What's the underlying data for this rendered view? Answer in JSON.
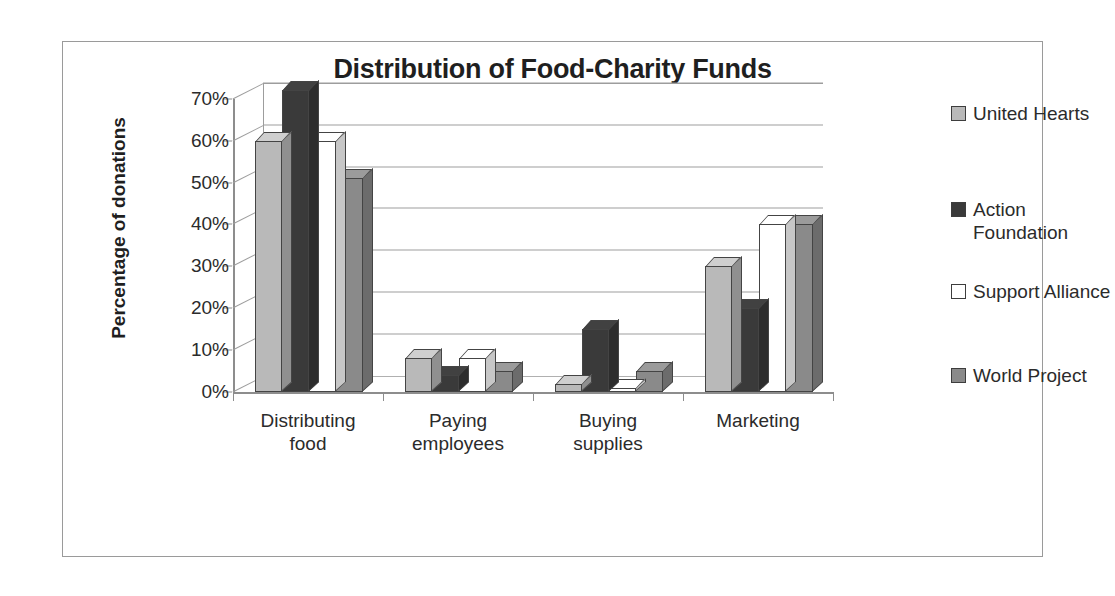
{
  "chart_data": {
    "type": "bar",
    "title": "Distribution of Food-Charity Funds",
    "xlabel": "",
    "ylabel": "Percentage of donations",
    "ylim": [
      0,
      70
    ],
    "ytick_labels": [
      "0%",
      "10%",
      "20%",
      "30%",
      "40%",
      "50%",
      "60%",
      "70%"
    ],
    "ytick_values": [
      0,
      10,
      20,
      30,
      40,
      50,
      60,
      70
    ],
    "grid": true,
    "legend_position": "right",
    "three_d": true,
    "categories": [
      "Distributing food",
      "Paying employees",
      "Buying supplies",
      "Marketing"
    ],
    "category_lines": [
      [
        "Distributing",
        "food"
      ],
      [
        "Paying",
        "employees"
      ],
      [
        "Buying",
        "supplies"
      ],
      [
        "Marketing"
      ]
    ],
    "series": [
      {
        "name": "United Hearts",
        "color": "#b9b9b9",
        "values": [
          60,
          8,
          2,
          30
        ]
      },
      {
        "name": "Action Foundation",
        "color": "#3a3a3a",
        "values": [
          72,
          4,
          15,
          20
        ]
      },
      {
        "name": "Support Alliance",
        "color": "#ffffff",
        "values": [
          60,
          8,
          1,
          40
        ]
      },
      {
        "name": "World Project",
        "color": "#8a8a8a",
        "values": [
          51,
          5,
          5,
          40
        ]
      }
    ]
  },
  "legend": {
    "items": [
      {
        "label": "United Hearts",
        "color": "#b9b9b9"
      },
      {
        "label": "Action\nFoundation",
        "color": "#3a3a3a"
      },
      {
        "label": "Support Alliance",
        "color": "#ffffff"
      },
      {
        "label": "World Project",
        "color": "#8a8a8a"
      }
    ]
  },
  "colors": {
    "frame_border": "#9a9a9a",
    "axis": "#8d8d8d",
    "gridline": "#9d9d9d",
    "text": "#2b2b2b",
    "title_text": "#1f1f1f",
    "background": "#ffffff"
  }
}
